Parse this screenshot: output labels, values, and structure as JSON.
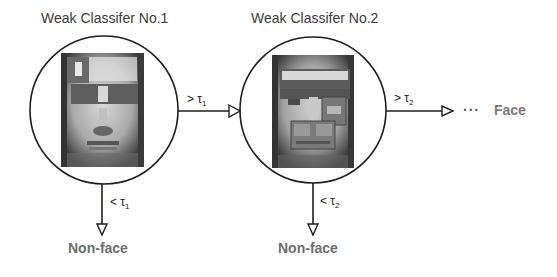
{
  "stages": [
    {
      "title": "Weak Classifer No.1",
      "pass_operator": ">",
      "pass_symbol": "τ",
      "pass_index": "1",
      "reject_operator": "<",
      "reject_symbol": "τ",
      "reject_index": "1",
      "reject_label": "Non-face"
    },
    {
      "title": "Weak Classifer No.2",
      "pass_operator": ">",
      "pass_symbol": "τ",
      "pass_index": "2",
      "reject_operator": "<",
      "reject_symbol": "τ",
      "reject_index": "2",
      "reject_label": "Non-face"
    }
  ],
  "continuation": "···",
  "final_label": "Face",
  "colors": {
    "stroke": "#1e1e1e",
    "title_text": "#3a3a3a",
    "outcome_text": "#6e6e6e",
    "face_text": "#7a7a7a"
  }
}
